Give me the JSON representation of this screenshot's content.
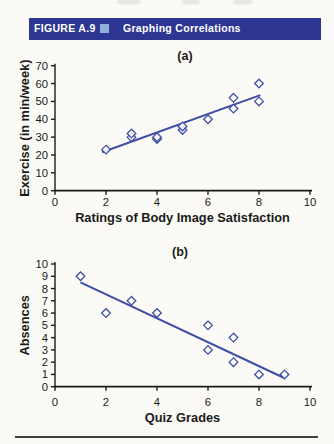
{
  "figure_header": {
    "label": "FIGURE A.9",
    "title": "Graphing Correlations",
    "bar_color": "#2d3793",
    "square_color": "#8fb0d9"
  },
  "chart_data": [
    {
      "type": "scatter",
      "panel_label": "(a)",
      "xlabel": "Ratings of Body Image Satisfaction",
      "ylabel": "Exercise (in min/week)",
      "xlim": [
        0,
        10
      ],
      "ylim": [
        0,
        70
      ],
      "xticks": [
        0,
        2,
        4,
        6,
        8,
        10
      ],
      "yticks": [
        0,
        10,
        20,
        30,
        40,
        50,
        60,
        70
      ],
      "points": [
        [
          2,
          23
        ],
        [
          3,
          30
        ],
        [
          3,
          32
        ],
        [
          4,
          29
        ],
        [
          4,
          30
        ],
        [
          5,
          34
        ],
        [
          5,
          36
        ],
        [
          6,
          40
        ],
        [
          7,
          46
        ],
        [
          7,
          52
        ],
        [
          8,
          50
        ],
        [
          8,
          60
        ]
      ],
      "trend_line": {
        "x1": 1.85,
        "y1": 21.5,
        "x2": 8.05,
        "y2": 53.5
      },
      "marker": "open-diamond",
      "accent_color": "#3f4da4",
      "axis_color": "#1a1a1a",
      "grid": false,
      "legend": null
    },
    {
      "type": "scatter",
      "panel_label": "(b)",
      "xlabel": "Quiz Grades",
      "ylabel": "Absences",
      "xlim": [
        0,
        10
      ],
      "ylim": [
        0,
        10
      ],
      "xticks": [
        0,
        2,
        4,
        6,
        8,
        10
      ],
      "yticks": [
        0,
        1,
        2,
        3,
        4,
        5,
        6,
        7,
        8,
        9,
        10
      ],
      "points": [
        [
          1,
          9
        ],
        [
          2,
          6
        ],
        [
          3,
          7
        ],
        [
          4,
          6
        ],
        [
          6,
          5
        ],
        [
          6,
          3
        ],
        [
          7,
          4
        ],
        [
          7,
          2
        ],
        [
          8,
          1
        ],
        [
          9,
          1
        ]
      ],
      "trend_line": {
        "x1": 1.0,
        "y1": 8.5,
        "x2": 8.95,
        "y2": 0.75
      },
      "marker": "open-diamond",
      "accent_color": "#3f4da4",
      "axis_color": "#1a1a1a",
      "grid": false,
      "legend": null
    }
  ],
  "bottom_rule_color": "#3f3f3f"
}
